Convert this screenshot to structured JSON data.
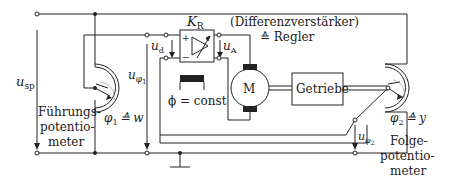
{
  "diagram": {
    "labels": {
      "u_sp": "u",
      "u_sp_sub": "sp",
      "u_phi1": "u",
      "u_phi1_sub": "φ",
      "u_phi1_subsub": "1",
      "u_d": "u",
      "u_d_sub": "d",
      "u_A": "u",
      "u_A_sub": "A",
      "K_R": "K",
      "K_R_sub": "R",
      "amp_line1": "(Differenzverstärker)",
      "amp_line2": "≙ Regler",
      "phi_const": "ϕ = const",
      "motor": "M",
      "gearbox": "Getriebe",
      "phi1": "φ",
      "phi1_sub": "1",
      "phi1_eq": "≙ w",
      "phi2": "φ",
      "phi2_sub": "2",
      "phi2_eq": "≙ y",
      "u_phi2": "u",
      "u_phi2_sub": "φ",
      "u_phi2_subsub": "2",
      "fuehrung_1": "Führungs-",
      "fuehrung_2": "potentio-",
      "fuehrung_3": "meter",
      "folge_1": "Folge-",
      "folge_2": "potentio-",
      "folge_3": "meter",
      "plus": "+",
      "minus": "−"
    }
  }
}
